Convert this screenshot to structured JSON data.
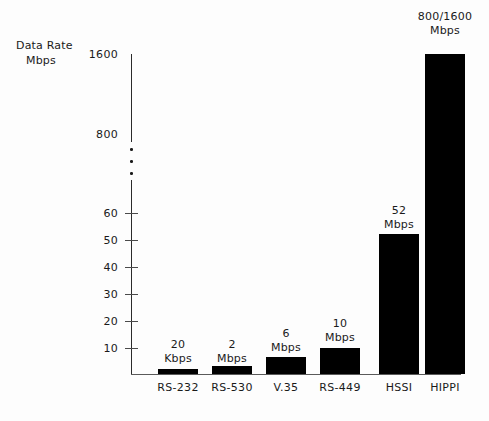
{
  "chart_data": {
    "type": "bar",
    "title": "",
    "ylabel_line1": "Data Rate",
    "ylabel_line2": "Mbps",
    "xlabel": "",
    "categories": [
      "RS-232",
      "RS-530",
      "V.35",
      "RS-449",
      "HSSI",
      "HIPPI"
    ],
    "values": [
      0.02,
      2,
      6,
      10,
      52,
      1600
    ],
    "value_labels": [
      {
        "line1": "20",
        "line2": "Kbps"
      },
      {
        "line1": "2",
        "line2": "Mbps"
      },
      {
        "line1": "6",
        "line2": "Mbps"
      },
      {
        "line1": "10",
        "line2": "Mbps"
      },
      {
        "line1": "52",
        "line2": "Mbps"
      },
      {
        "line1": "800/1600",
        "line2": "Mbps"
      }
    ],
    "units": [
      "Kbps",
      "Mbps",
      "Mbps",
      "Mbps",
      "Mbps",
      "Mbps"
    ],
    "ytick_labels": [
      "1600",
      "800",
      "60",
      "50",
      "40",
      "30",
      "20",
      "10"
    ],
    "ylim_lower_section": [
      0,
      60
    ],
    "ylim_upper_section": [
      800,
      1600
    ],
    "axis_break": true,
    "axis_break_marker": "three-dots",
    "grid": false,
    "legend": null,
    "bar_color": "#000000",
    "axis_color": "#2b2b2b"
  },
  "ticks": {
    "upper": [
      {
        "label": "1600",
        "y": 54,
        "has_mark": false
      },
      {
        "label": "800",
        "y": 134,
        "has_mark": false
      }
    ],
    "lower": [
      {
        "label": "60",
        "y": 213,
        "has_mark": true
      },
      {
        "label": "50",
        "y": 240,
        "has_mark": true
      },
      {
        "label": "40",
        "y": 267,
        "has_mark": true
      },
      {
        "label": "30",
        "y": 294,
        "has_mark": true
      },
      {
        "label": "20",
        "y": 321,
        "has_mark": true
      },
      {
        "label": "10",
        "y": 348,
        "has_mark": true
      }
    ]
  },
  "bars": [
    {
      "name": "RS-232",
      "left": 158,
      "width": 40,
      "top": 369,
      "height": 5,
      "label_top": 338
    },
    {
      "name": "RS-530",
      "left": 212,
      "width": 40,
      "top": 366,
      "height": 8,
      "label_top": 338
    },
    {
      "name": "V.35",
      "left": 266,
      "width": 40,
      "top": 357,
      "height": 17,
      "label_top": 327
    },
    {
      "name": "RS-449",
      "left": 320,
      "width": 40,
      "top": 348,
      "height": 26,
      "label_top": 317
    },
    {
      "name": "HSSI",
      "left": 379,
      "width": 40,
      "top": 234,
      "height": 140,
      "label_top": 204
    },
    {
      "name": "HIPPI",
      "left": 425,
      "width": 40,
      "top": 54,
      "height": 320,
      "label_top": 10
    }
  ],
  "break_dots": [
    {
      "y": 148
    },
    {
      "y": 160
    },
    {
      "y": 172
    }
  ]
}
